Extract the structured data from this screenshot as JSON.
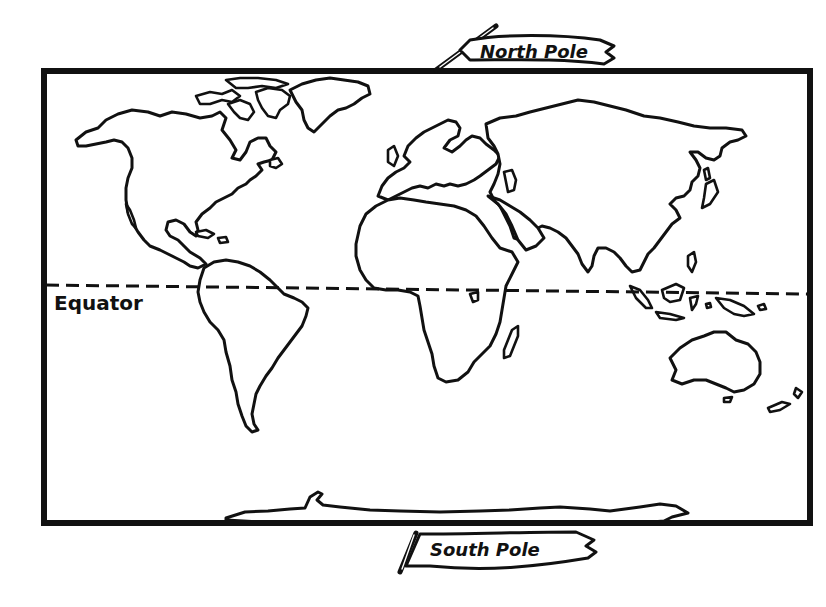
{
  "map": {
    "title": "World Map",
    "style": "black-and-white hand-drawn outline",
    "colors": {
      "ink": "#111111",
      "paper": "#ffffff"
    },
    "labels": {
      "north_pole": "North Pole",
      "south_pole": "South Pole",
      "equator": "Equator"
    },
    "features": [
      "North America",
      "Greenland",
      "South America",
      "Europe",
      "Africa",
      "Madagascar",
      "Asia",
      "Japan",
      "Indonesia",
      "Australia",
      "New Zealand",
      "Antarctica"
    ],
    "lines": [
      {
        "name": "Equator",
        "style": "dashed"
      }
    ]
  }
}
